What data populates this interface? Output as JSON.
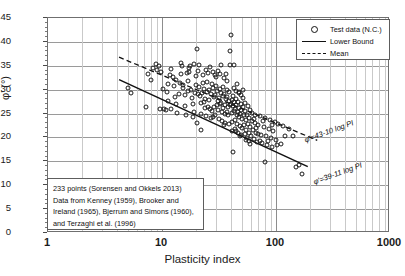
{
  "chart_data": {
    "type": "scatter",
    "title": "",
    "xlabel": "Plasticity index",
    "ylabel": "φ' (°)",
    "xscale": "log",
    "xlim": [
      1,
      1000
    ],
    "ylim": [
      0,
      45
    ],
    "xticks": [
      "1",
      "10",
      "100",
      "1000"
    ],
    "yticks": [
      "0",
      "5",
      "10",
      "15",
      "20",
      "25",
      "30",
      "35",
      "40",
      "45"
    ],
    "grid": true,
    "legend_position": "top-right",
    "legend": [
      {
        "label": "Test data (N.C.)",
        "marker": "open-circle"
      },
      {
        "label": "Lower Bound",
        "marker": "solid-line"
      },
      {
        "label": "Mean",
        "marker": "dashed-line"
      }
    ],
    "annotations": [
      {
        "text": "φ'=43-10 log PI",
        "series": "Mean"
      },
      {
        "text": "φ'=39-11 log PI",
        "series": "Lower Bound"
      }
    ],
    "series": [
      {
        "name": "Mean",
        "type": "line",
        "style": "dashed",
        "equation": "phi = 43 - 10*log10(PI)",
        "x_range": [
          4.2,
          230
        ],
        "endpoints": [
          [
            4.2,
            36.8
          ],
          [
            230,
            19.4
          ]
        ]
      },
      {
        "name": "Lower Bound",
        "type": "line",
        "style": "solid",
        "equation": "phi = 39 - 11*log10(PI)",
        "x_range": [
          4.2,
          190
        ],
        "endpoints": [
          [
            4.2,
            32.1
          ],
          [
            190,
            13.9
          ]
        ]
      },
      {
        "name": "Test data (N.C.)",
        "type": "scatter",
        "n_points": 233,
        "points": [
          [
            5.0,
            30.3
          ],
          [
            5.4,
            29.2
          ],
          [
            7.2,
            26.4
          ],
          [
            7.6,
            33.3
          ],
          [
            8.0,
            32.1
          ],
          [
            8.4,
            34.6
          ],
          [
            8.8,
            35.3
          ],
          [
            9.0,
            34.2
          ],
          [
            9.4,
            35.0
          ],
          [
            9.8,
            33.6
          ],
          [
            10.2,
            30.1
          ],
          [
            10.4,
            26.0
          ],
          [
            10.8,
            25.8
          ],
          [
            11.0,
            29.6
          ],
          [
            11.4,
            31.2
          ],
          [
            11.8,
            33.0
          ],
          [
            12.0,
            34.4
          ],
          [
            12.4,
            32.6
          ],
          [
            12.8,
            30.8
          ],
          [
            13.0,
            28.4
          ],
          [
            13.4,
            27.0
          ],
          [
            13.6,
            25.2
          ],
          [
            14.0,
            29.0
          ],
          [
            14.4,
            31.5
          ],
          [
            14.8,
            33.2
          ],
          [
            15.0,
            34.9
          ],
          [
            15.4,
            30.4
          ],
          [
            15.8,
            28.8
          ],
          [
            16.0,
            26.6
          ],
          [
            16.4,
            24.6
          ],
          [
            16.8,
            29.8
          ],
          [
            17.0,
            31.8
          ],
          [
            17.4,
            33.6
          ],
          [
            17.6,
            35.0
          ],
          [
            18.0,
            30.0
          ],
          [
            18.2,
            28.2
          ],
          [
            18.6,
            26.9
          ],
          [
            19.0,
            25.4
          ],
          [
            19.4,
            29.4
          ],
          [
            19.8,
            31.0
          ],
          [
            20.0,
            32.8
          ],
          [
            20.2,
            38.5
          ],
          [
            20.6,
            34.0
          ],
          [
            21.0,
            30.6
          ],
          [
            21.4,
            28.6
          ],
          [
            21.8,
            27.2
          ],
          [
            22.0,
            25.0
          ],
          [
            22.4,
            29.2
          ],
          [
            22.8,
            31.4
          ],
          [
            23.0,
            33.0
          ],
          [
            23.4,
            30.2
          ],
          [
            23.8,
            28.0
          ],
          [
            24.0,
            26.2
          ],
          [
            24.4,
            24.4
          ],
          [
            24.8,
            29.6
          ],
          [
            25.0,
            31.6
          ],
          [
            25.4,
            33.4
          ],
          [
            25.8,
            30.0
          ],
          [
            26.0,
            27.8
          ],
          [
            26.4,
            26.0
          ],
          [
            26.8,
            24.0
          ],
          [
            27.0,
            29.0
          ],
          [
            27.4,
            31.2
          ],
          [
            27.8,
            33.8
          ],
          [
            28.0,
            30.4
          ],
          [
            28.4,
            28.4
          ],
          [
            28.8,
            26.4
          ],
          [
            29.0,
            24.8
          ],
          [
            29.4,
            28.8
          ],
          [
            29.8,
            30.8
          ],
          [
            30.0,
            32.6
          ],
          [
            30.4,
            29.8
          ],
          [
            30.8,
            27.6
          ],
          [
            31.0,
            25.8
          ],
          [
            31.4,
            23.8
          ],
          [
            31.8,
            28.2
          ],
          [
            32.0,
            30.2
          ],
          [
            32.4,
            33.2
          ],
          [
            32.8,
            29.4
          ],
          [
            33.0,
            27.2
          ],
          [
            33.4,
            25.4
          ],
          [
            33.8,
            23.4
          ],
          [
            34.0,
            28.6
          ],
          [
            34.4,
            30.6
          ],
          [
            34.8,
            32.4
          ],
          [
            35.0,
            29.0
          ],
          [
            35.4,
            26.8
          ],
          [
            35.8,
            25.0
          ],
          [
            36.0,
            23.0
          ],
          [
            36.4,
            28.0
          ],
          [
            36.8,
            30.0
          ],
          [
            37.0,
            31.8
          ],
          [
            37.4,
            28.4
          ],
          [
            37.8,
            26.4
          ],
          [
            38.0,
            24.6
          ],
          [
            38.4,
            22.8
          ],
          [
            38.8,
            27.6
          ],
          [
            39.0,
            29.6
          ],
          [
            39.4,
            35.2
          ],
          [
            39.8,
            38.0
          ],
          [
            40.0,
            41.5
          ],
          [
            40.4,
            27.0
          ],
          [
            40.8,
            25.2
          ],
          [
            41.0,
            23.2
          ],
          [
            41.4,
            21.4
          ],
          [
            41.8,
            26.6
          ],
          [
            42.0,
            28.6
          ],
          [
            42.4,
            30.4
          ],
          [
            42.8,
            27.4
          ],
          [
            43.0,
            25.6
          ],
          [
            43.4,
            23.6
          ],
          [
            43.8,
            21.8
          ],
          [
            44.0,
            26.0
          ],
          [
            44.4,
            28.0
          ],
          [
            44.8,
            29.8
          ],
          [
            45.0,
            26.8
          ],
          [
            45.4,
            24.8
          ],
          [
            45.8,
            22.9
          ],
          [
            46.0,
            20.9
          ],
          [
            46.4,
            25.4
          ],
          [
            46.8,
            27.4
          ],
          [
            47.0,
            29.2
          ],
          [
            47.4,
            26.2
          ],
          [
            47.8,
            24.2
          ],
          [
            48.0,
            22.4
          ],
          [
            48.4,
            20.4
          ],
          [
            48.8,
            25.0
          ],
          [
            49.0,
            27.0
          ],
          [
            49.4,
            28.8
          ],
          [
            49.8,
            25.8
          ],
          [
            50.0,
            23.8
          ],
          [
            50.5,
            21.9
          ],
          [
            51.0,
            26.4
          ],
          [
            51.5,
            28.2
          ],
          [
            52.0,
            24.6
          ],
          [
            52.5,
            22.6
          ],
          [
            53.0,
            20.8
          ],
          [
            53.5,
            25.6
          ],
          [
            54.0,
            27.2
          ],
          [
            54.5,
            23.6
          ],
          [
            55.0,
            21.6
          ],
          [
            55.5,
            19.8
          ],
          [
            56.0,
            24.8
          ],
          [
            56.5,
            26.6
          ],
          [
            57.0,
            22.8
          ],
          [
            57.5,
            20.9
          ],
          [
            58.0,
            19.2
          ],
          [
            58.5,
            24.0
          ],
          [
            59.0,
            25.8
          ],
          [
            59.5,
            22.2
          ],
          [
            60.0,
            20.2
          ],
          [
            61.0,
            23.4
          ],
          [
            62.0,
            25.2
          ],
          [
            63.0,
            21.6
          ],
          [
            64.0,
            19.6
          ],
          [
            65.0,
            23.0
          ],
          [
            66.0,
            24.8
          ],
          [
            67.0,
            21.0
          ],
          [
            68.0,
            19.0
          ],
          [
            70.0,
            22.6
          ],
          [
            72.0,
            24.4
          ],
          [
            74.0,
            20.6
          ],
          [
            76.0,
            18.8
          ],
          [
            78.0,
            22.2
          ],
          [
            80.0,
            24.0
          ],
          [
            82.0,
            20.2
          ],
          [
            84.0,
            18.4
          ],
          [
            86.0,
            21.8
          ],
          [
            88.0,
            23.6
          ],
          [
            90.0,
            19.8
          ],
          [
            92.0,
            18.0
          ],
          [
            95.0,
            21.4
          ],
          [
            98.0,
            23.2
          ],
          [
            100.0,
            19.4
          ],
          [
            105.0,
            22.9
          ],
          [
            110.0,
            18.6
          ],
          [
            115.0,
            22.3
          ],
          [
            120.0,
            20.4
          ],
          [
            130.0,
            21.8
          ],
          [
            140.0,
            20.2
          ],
          [
            150.0,
            13.9
          ],
          [
            160.0,
            14.3
          ],
          [
            170.0,
            12.3
          ],
          [
            80.0,
            14.8
          ],
          [
            42.0,
            16.9
          ],
          [
            22.0,
            21.6
          ],
          [
            12.0,
            26.0
          ],
          [
            9.6,
            25.9
          ],
          [
            19.2,
            35.4
          ],
          [
            21.2,
            35.2
          ],
          [
            26.2,
            34.8
          ],
          [
            17.2,
            34.6
          ],
          [
            14.6,
            35.6
          ],
          [
            16.6,
            33.4
          ],
          [
            24.2,
            34.2
          ],
          [
            29.2,
            33.0
          ],
          [
            31.2,
            34.0
          ],
          [
            33.2,
            35.2
          ],
          [
            36.2,
            33.2
          ],
          [
            43.2,
            35.2
          ],
          [
            45.2,
            31.2
          ],
          [
            47.2,
            29.6
          ],
          [
            51.2,
            30.0
          ],
          [
            20.8,
            29.0
          ],
          [
            23.2,
            27.4
          ],
          [
            25.2,
            26.4
          ],
          [
            27.2,
            25.6
          ],
          [
            30.2,
            26.8
          ],
          [
            32.2,
            27.0
          ],
          [
            34.2,
            26.2
          ],
          [
            37.2,
            25.4
          ],
          [
            39.2,
            26.8
          ],
          [
            41.2,
            27.8
          ],
          [
            28.2,
            24.2
          ],
          [
            35.2,
            22.6
          ],
          [
            44.2,
            21.4
          ],
          [
            49.2,
            20.6
          ],
          [
            54.2,
            19.4
          ],
          [
            59.2,
            18.6
          ],
          [
            64.2,
            23.8
          ],
          [
            66.2,
            22.0
          ],
          [
            69.0,
            20.8
          ],
          [
            73.0,
            19.2
          ],
          [
            77.0,
            23.4
          ],
          [
            85.0,
            19.2
          ],
          [
            93.0,
            22.6
          ],
          [
            102.0,
            18.4
          ],
          [
            13.2,
            32.0
          ],
          [
            15.2,
            31.0
          ],
          [
            11.2,
            27.6
          ],
          [
            18.8,
            24.2
          ],
          [
            20.4,
            23.0
          ]
        ]
      }
    ]
  },
  "notebox": {
    "lines": [
      "233 points (Sorensen  and Okkels 2013)",
      "Data from Kenney (1959), Brooker and",
      "Ireland (1965), Bjerrum and Simons (1960),",
      "and Terzaghi et al. (1996)"
    ]
  }
}
